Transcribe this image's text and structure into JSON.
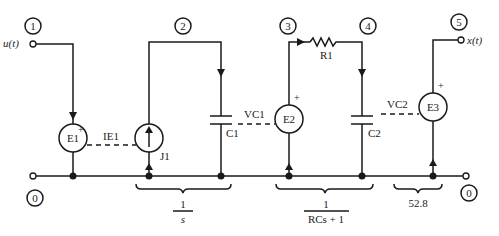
{
  "nodes": [
    {
      "id": "0",
      "label": "0"
    },
    {
      "id": "1",
      "label": "1"
    },
    {
      "id": "2",
      "label": "2"
    },
    {
      "id": "3",
      "label": "3"
    },
    {
      "id": "4",
      "label": "4"
    },
    {
      "id": "5",
      "label": "5"
    }
  ],
  "terminals": {
    "input": "u(t)",
    "output": "x(t)"
  },
  "components": {
    "e1": "E1",
    "j1": "J1",
    "c1": "C1",
    "e2": "E2",
    "r1": "R1",
    "c2": "C2",
    "e3": "E3"
  },
  "controls": {
    "ie1": "IE1",
    "vc1": "VC1",
    "vc2": "VC2"
  },
  "polarity": "+",
  "transfer_functions": {
    "integrator": {
      "numerator": "1",
      "denominator": "s"
    },
    "lag": {
      "numerator": "1",
      "denominator": "RCs + 1"
    },
    "gain": "52.8"
  }
}
